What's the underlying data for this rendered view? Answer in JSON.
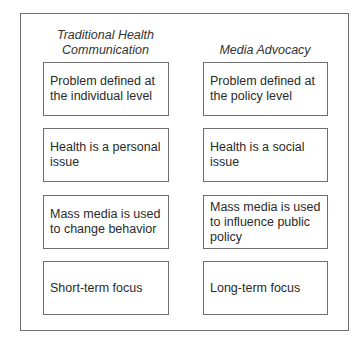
{
  "diagram": {
    "columns": [
      {
        "title": "Traditional Health Communication",
        "title_lines": [
          "Traditional Health",
          "Communication"
        ],
        "items": [
          "Problem defined at the individual level",
          "Health is a personal issue",
          "Mass media is used to change behavior",
          "Short-term focus"
        ]
      },
      {
        "title": "Media Advocacy",
        "title_lines": [
          "Media Advocacy"
        ],
        "items": [
          "Problem defined at the policy level",
          "Health is a social issue",
          "Mass media is used to influence public policy",
          "Long-term focus"
        ]
      }
    ]
  }
}
